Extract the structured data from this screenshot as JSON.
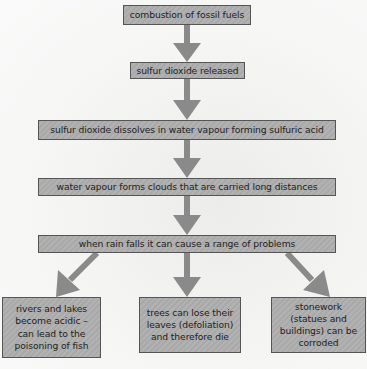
{
  "diagram": {
    "title": "",
    "steps": [
      "combustion of fossil fuels",
      "sulfur dioxide released",
      "sulfur dioxide dissolves in water vapour forming sulfuric acid",
      "water vapour forms clouds that are carried long distances",
      "when rain falls it can cause a range of problems"
    ],
    "effects": [
      "rivers and lakes become acidic – can lead to the poisoning of fish",
      "trees can lose their leaves (defoliation) and therefore die",
      "stonework (statues and buildings) can be corroded"
    ],
    "colors": {
      "box_fill": "#adadad",
      "box_border": "#555555",
      "arrow": "#8a8a8a",
      "text": "#222222"
    }
  }
}
